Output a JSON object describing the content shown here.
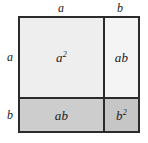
{
  "diagram": {
    "identity": "(a + b)^2 = a^2 + 2ab + b^2",
    "edge_labels": {
      "top_left": "a",
      "top_right": "b",
      "left_upper": "a",
      "left_lower": "b"
    },
    "regions": [
      {
        "name": "a-squared",
        "base": "a",
        "exponent": "2",
        "position": "top-left",
        "fill": "#eeeeee"
      },
      {
        "name": "ab-top",
        "base": "ab",
        "exponent": "",
        "position": "top-right",
        "fill": "#f4f4f4"
      },
      {
        "name": "ab-bottom",
        "base": "ab",
        "exponent": "",
        "position": "bottom-left",
        "fill": "#cdcdcd"
      },
      {
        "name": "b-squared",
        "base": "b",
        "exponent": "2",
        "position": "bottom-right",
        "fill": "#c6c6c6"
      }
    ],
    "colors": {
      "stroke": "#2b2b2b",
      "background": "#ffffff",
      "text": "#1a1a1a"
    }
  }
}
